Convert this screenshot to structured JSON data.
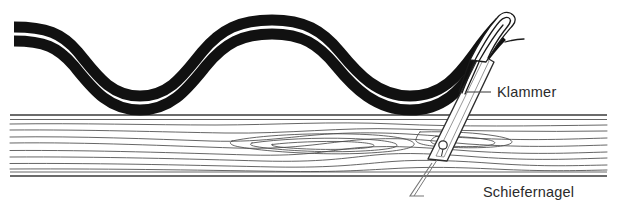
{
  "figure": {
    "background_color": "#ffffff",
    "width": 617,
    "height": 210
  },
  "colors": {
    "corrugation": "#111111",
    "wood_outline": "#3d3d3d",
    "wood_grain": "#4a4a4a",
    "nail_outline": "#2e2e2e",
    "clamp_outline": "#1a1a1a",
    "leader_line": "#555555",
    "label_text": "#2b2b2b"
  },
  "corrugated_sheet": {
    "name": "corrugated-roof-profile",
    "description": "Zwei parallele Wellenlinien im Querschnitt",
    "crest_y": 20,
    "trough_y": 104,
    "wavelength": 272,
    "start_x": 14,
    "end_x": 500,
    "band_width": 11,
    "band_gap": 7
  },
  "wood_batten": {
    "name": "wood-batten",
    "top_edge_y": 115,
    "bottom_edge_y": 176,
    "left_x": 10,
    "right_x": 607,
    "grain_line_count": 12,
    "has_knot": true,
    "knot_center_x": 300
  },
  "slate_nail": {
    "name": "slate-nail",
    "angle_deg": 16,
    "head_x": 486,
    "head_y": 60,
    "tip_x": 426,
    "tip_y": 160,
    "hole_center_x": 443,
    "hole_center_y": 146,
    "hole_radius": 4
  },
  "clamp": {
    "name": "clamp-bracket",
    "hook_top_x": 502,
    "hook_top_y": 14,
    "description": "Klammer greift ueber den Wellenberg"
  },
  "labels": [
    {
      "id": "klammer",
      "name": "label-klammer",
      "text": "Klammer",
      "text_x": 497,
      "text_y": 97,
      "leader": {
        "x1": 465,
        "y1": 92,
        "x2": 491,
        "y2": 92
      }
    },
    {
      "id": "schiefernagel",
      "name": "label-schiefernagel",
      "text": "Schiefernagel",
      "text_x": 483,
      "text_y": 197,
      "leader": {
        "x1": 432,
        "y1": 163,
        "x2": 410,
        "y2": 196,
        "elbow_x": 424,
        "elbow_y": 196
      }
    }
  ]
}
